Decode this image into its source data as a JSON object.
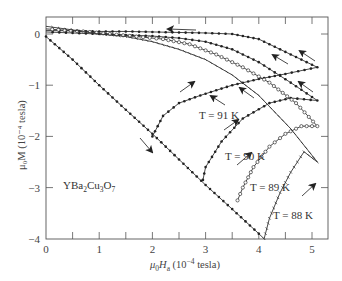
{
  "chart_data": {
    "type": "line",
    "title": "",
    "xlabel": "μ0Ha (10^-4 tesla)",
    "ylabel": "μ0M (10^-4 tesla)",
    "xlim": [
      0,
      5.25
    ],
    "ylim": [
      -4,
      0.3
    ],
    "xticks": [
      0,
      1,
      2,
      3,
      4,
      5
    ],
    "xticks_minor": [
      0.5,
      1.5,
      2.5,
      3.5,
      4.5
    ],
    "yticks": [
      0,
      -1,
      -2,
      -3,
      -4
    ],
    "grid": false,
    "legend": null,
    "annotations": [
      {
        "text": "YBa2Cu3O7",
        "x": 0.55,
        "y": -3.0
      },
      {
        "text": "T = 91 K",
        "x": 2.9,
        "y": -1.55
      },
      {
        "text": "T = 90 K",
        "x": 3.25,
        "y": -2.35
      },
      {
        "text": "T = 89 K",
        "x": 3.8,
        "y": -2.95
      },
      {
        "text": "T = 88 K",
        "x": 4.3,
        "y": -3.55
      }
    ],
    "series": [
      {
        "name": "Initial (virgin) magnetization",
        "marker": "dot",
        "x": [
          0,
          0.5,
          1.0,
          1.5,
          2.0,
          2.5,
          3.0,
          3.5,
          4.0,
          4.1
        ],
        "y": [
          -0.05,
          -0.5,
          -1.0,
          -1.48,
          -1.95,
          -2.45,
          -2.95,
          -3.42,
          -3.9,
          -4.0
        ]
      },
      {
        "name": "T = 91 K",
        "marker": "dot",
        "x": [
          2.0,
          2.2,
          2.5,
          2.9,
          3.5,
          4.0,
          4.5,
          5.1,
          4.5,
          4.0,
          3.5,
          3.0,
          2.5,
          2.0,
          1.5,
          1.0,
          0.5,
          0.0
        ],
        "y": [
          -2.0,
          -1.6,
          -1.35,
          -1.2,
          -1.0,
          -0.88,
          -0.78,
          -0.65,
          -0.35,
          -0.1,
          0.0,
          0.02,
          0.03,
          0.04,
          0.05,
          0.05,
          0.06,
          0.07
        ]
      },
      {
        "name": "T = 90 K",
        "marker": "dot",
        "x": [
          2.95,
          3.0,
          3.3,
          3.7,
          4.2,
          4.6,
          5.1,
          4.6,
          4.0,
          3.5,
          3.0,
          2.5,
          2.0,
          1.5,
          1.0,
          0.5,
          0.0
        ],
        "y": [
          -2.85,
          -2.6,
          -2.1,
          -1.65,
          -1.35,
          -1.25,
          -1.3,
          -0.95,
          -0.55,
          -0.3,
          -0.15,
          -0.08,
          -0.04,
          -0.02,
          0.0,
          0.02,
          0.04
        ]
      },
      {
        "name": "T = 89 K",
        "marker": "circle",
        "x": [
          3.6,
          3.7,
          3.9,
          4.2,
          4.5,
          4.8,
          5.1,
          4.7,
          4.2,
          3.7,
          3.2,
          2.7,
          2.2,
          1.7,
          1.2,
          0.7,
          0.0
        ],
        "y": [
          -3.25,
          -3.0,
          -2.6,
          -2.2,
          -1.95,
          -1.8,
          -1.8,
          -1.35,
          -0.95,
          -0.65,
          -0.4,
          -0.2,
          -0.1,
          -0.05,
          0.0,
          0.05,
          0.1
        ]
      },
      {
        "name": "T = 88 K",
        "marker": "tick",
        "x": [
          4.1,
          4.2,
          4.4,
          4.6,
          4.85,
          5.1,
          4.6,
          4.0,
          3.5,
          3.0,
          2.5,
          2.0,
          1.5,
          1.0,
          0.5,
          0.0
        ],
        "y": [
          -4.0,
          -3.6,
          -3.1,
          -2.7,
          -2.3,
          -2.5,
          -1.85,
          -1.2,
          -0.8,
          -0.5,
          -0.3,
          -0.15,
          -0.05,
          0.0,
          0.08,
          0.15
        ]
      }
    ]
  },
  "labels": {
    "x_axis_title_prefix": "μ",
    "x_axis_title_sub": "0",
    "x_axis_title_var": "H",
    "x_axis_title_varsub": "a",
    "x_axis_title_unit": " (10",
    "x_axis_title_exp": "−4",
    "x_axis_title_tail": " tesla)",
    "y_axis_title": "μ₀M (10⁻⁴ tesla)",
    "compound_main": "YBa",
    "compound_s1": "2",
    "compound_mid": "Cu",
    "compound_s2": "3",
    "compound_end": "O",
    "compound_s3": "7",
    "t91": "T = 91 K",
    "t90": "T = 90 K",
    "t89": "T = 89 K",
    "t88": "T = 88 K",
    "xtick_labels": [
      "0",
      "1",
      "2",
      "3",
      "4",
      "5"
    ],
    "ytick_labels": [
      "0",
      "−1",
      "−2",
      "−3",
      "−4"
    ]
  }
}
